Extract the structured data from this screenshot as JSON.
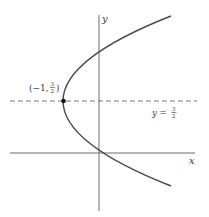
{
  "diagram": {
    "type": "parabola-graph",
    "equation_hint": "horizontal parabola opening right with vertex at (-1, 3/2)",
    "axes": {
      "x_label": "x",
      "y_label": "y"
    },
    "vertex": {
      "label": "(−1, 3/2)",
      "label_prefix": "(−1,",
      "frac_num": "3",
      "frac_den": "2",
      "label_suffix": ")"
    },
    "axis_of_symmetry": {
      "label_prefix": "y =",
      "frac_num": "3",
      "frac_den": "2",
      "style": "dashed"
    },
    "colors": {
      "curve": "#4a4a4a",
      "axes": "#6a6a6a",
      "dashed": "#777777",
      "point": "#111111",
      "background": "#ffffff"
    }
  }
}
